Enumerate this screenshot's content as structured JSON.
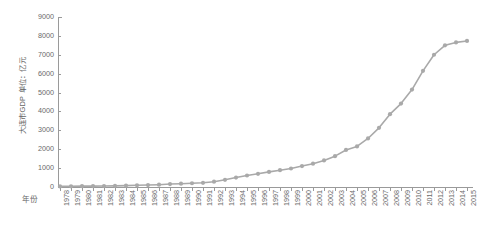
{
  "chart_data": {
    "type": "line",
    "title": "",
    "subtitle": "",
    "xlabel": "年份",
    "ylabel": "大连市GDP 单位：亿元",
    "ylim": [
      0,
      9000
    ],
    "y_ticks": [
      9000,
      8000,
      7000,
      6000,
      5000,
      4000,
      3000,
      2000,
      1000,
      0
    ],
    "y_tick_labels": [
      "9000",
      "8000",
      "7000",
      "6000",
      "5000",
      "4000",
      "3000",
      "2000",
      "1000",
      "0"
    ],
    "grid": false,
    "legend": "none",
    "series_color": "#a9a9a9",
    "marker": "circle",
    "categories": [
      "1978",
      "1979",
      "1980",
      "1981",
      "1982",
      "1983",
      "1984",
      "1985",
      "1986",
      "1987",
      "1988",
      "1989",
      "1990",
      "1991",
      "1992",
      "1993",
      "1994",
      "1995",
      "1996",
      "1997",
      "1998",
      "1999",
      "2000",
      "2001",
      "2002",
      "2003",
      "2004",
      "2005",
      "2006",
      "2007",
      "2008",
      "2009",
      "2010",
      "2011",
      "2012",
      "2013",
      "2014",
      "2015"
    ],
    "x_tick_labels": [
      "1978",
      "1979",
      "1980",
      "1981",
      "1982",
      "1983",
      "1984",
      "1985",
      "1986",
      "1987",
      "1988",
      "1989",
      "1990",
      "1991",
      "1992",
      "1993",
      "1994",
      "1995",
      "1996",
      "1997",
      "1998",
      "1999",
      "2000",
      "2001",
      "2002",
      "2003",
      "2004",
      "2005",
      "2006",
      "2007",
      "2008",
      "2009",
      "2010",
      "2011",
      "2012",
      "2013",
      "2014",
      "2015"
    ],
    "series": [
      {
        "name": "大连市GDP",
        "values": [
          33,
          38,
          44,
          48,
          54,
          61,
          73,
          90,
          102,
          123,
          156,
          176,
          198,
          222,
          280,
          380,
          500,
          610,
          700,
          800,
          890,
          980,
          1110,
          1235,
          1406,
          1633,
          1962,
          2150,
          2570,
          3131,
          3858,
          4418,
          5158,
          6150,
          7002,
          7500,
          7655,
          7732
        ]
      }
    ]
  }
}
